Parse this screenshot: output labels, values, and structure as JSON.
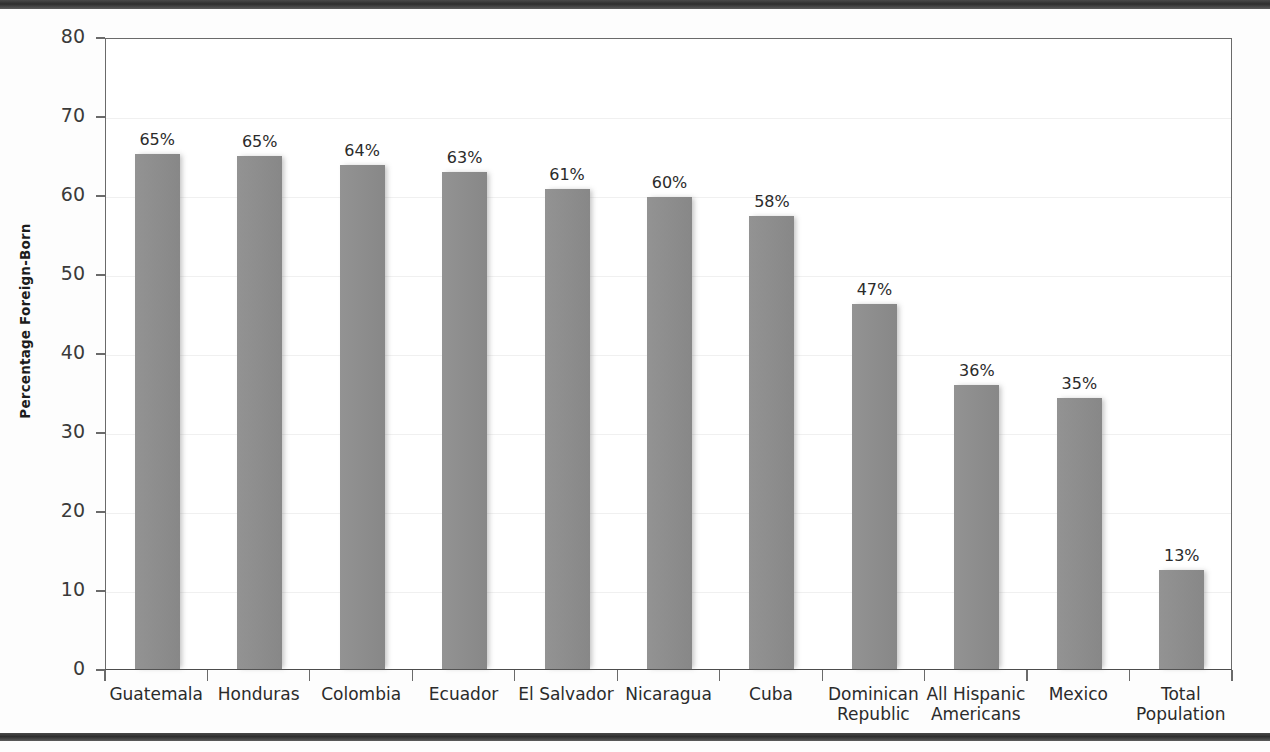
{
  "chart_data": {
    "type": "bar",
    "title": "",
    "subtitle": "",
    "xlabel": "",
    "ylabel": "Percentage Foreign-Born",
    "ylim": [
      0,
      80
    ],
    "ytick_values": [
      0,
      10,
      20,
      30,
      40,
      50,
      60,
      70,
      80
    ],
    "ytick_labels": [
      "0",
      "10",
      "20",
      "30",
      "40",
      "50",
      "60",
      "70",
      "80"
    ],
    "grid": true,
    "grid_axis": "y",
    "legend": false,
    "legend_position": "none",
    "bar_color": "#8d8d8d",
    "label_suffix": "%",
    "categories": [
      "Guatemala",
      "Honduras",
      "Colombia",
      "Ecuador",
      "El Salvador",
      "Nicaragua",
      "Cuba",
      "Dominican Republic",
      "All Hispanic Americans",
      "Mexico",
      "Total Population"
    ],
    "category_lines": [
      [
        "Guatemala"
      ],
      [
        "Honduras"
      ],
      [
        "Colombia"
      ],
      [
        "Ecuador"
      ],
      [
        "El Salvador"
      ],
      [
        "Nicaragua"
      ],
      [
        "Cuba"
      ],
      [
        "Dominican",
        "Republic"
      ],
      [
        "All Hispanic",
        "Americans"
      ],
      [
        "Mexico"
      ],
      [
        "Total",
        "Population"
      ]
    ],
    "values": [
      65.2,
      65.0,
      63.8,
      62.9,
      60.8,
      59.8,
      57.4,
      46.2,
      35.9,
      34.3,
      12.5
    ],
    "data_labels": [
      "65%",
      "65%",
      "64%",
      "63%",
      "61%",
      "60%",
      "58%",
      "47%",
      "36%",
      "35%",
      "13%"
    ]
  },
  "figure": {
    "background_color": "#ffffff",
    "frame_color": "#6a6a6a",
    "rule_color": "#2e2e2e"
  }
}
